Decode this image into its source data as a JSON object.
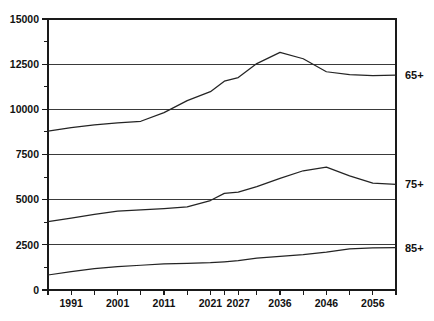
{
  "chart_data": {
    "type": "line",
    "title": "",
    "subtitle": "",
    "xlabel": "",
    "ylabel": "",
    "xlim": [
      1986,
      2061
    ],
    "ylim": [
      0,
      15000
    ],
    "grid": true,
    "grid_axis": "y",
    "legend_position": "right-inline",
    "x": [
      1986,
      1991,
      1996,
      2001,
      2006,
      2011,
      2016,
      2021,
      2024,
      2027,
      2031,
      2036,
      2041,
      2046,
      2051,
      2056,
      2061
    ],
    "x_tick_values": [
      1986,
      1991,
      1996,
      2001,
      2006,
      2011,
      2016,
      2021,
      2024,
      2027,
      2031,
      2036,
      2041,
      2046,
      2051,
      2056,
      2061
    ],
    "x_tick_labels": [
      "",
      "1991",
      "",
      "2001",
      "",
      "2011",
      "",
      "2021",
      "",
      "2027",
      "",
      "2036",
      "",
      "2046",
      "",
      "2056",
      ""
    ],
    "y_tick_values": [
      0,
      1250,
      2500,
      3750,
      5000,
      6250,
      7500,
      8750,
      10000,
      11250,
      12500,
      13750,
      15000
    ],
    "y_tick_labels": [
      "0",
      "",
      "2500",
      "",
      "5000",
      "",
      "7500",
      "",
      "10000",
      "",
      "12500",
      "",
      "15000"
    ],
    "y_major_values": [
      0,
      2500,
      5000,
      7500,
      10000,
      12500,
      15000
    ],
    "series": [
      {
        "name": "65+",
        "label": "65+",
        "color": "#242424",
        "values": [
          8790,
          8990,
          9140,
          9250,
          9340,
          9820,
          10480,
          10980,
          11560,
          11760,
          12530,
          13150,
          12800,
          12080,
          11920,
          11870,
          11900
        ]
      },
      {
        "name": "75+",
        "label": "75+",
        "color": "#242424",
        "values": [
          3780,
          3980,
          4180,
          4360,
          4440,
          4510,
          4600,
          4950,
          5350,
          5420,
          5720,
          6180,
          6600,
          6800,
          6320,
          5920,
          5850
        ]
      },
      {
        "name": "85+",
        "label": "85+",
        "color": "#242424",
        "values": [
          830,
          1020,
          1180,
          1300,
          1370,
          1440,
          1480,
          1510,
          1560,
          1620,
          1760,
          1860,
          1960,
          2090,
          2270,
          2330,
          2350
        ]
      }
    ]
  },
  "axes": {
    "frame": {
      "left": 48,
      "right": 396,
      "top": 19,
      "bottom": 290
    }
  }
}
